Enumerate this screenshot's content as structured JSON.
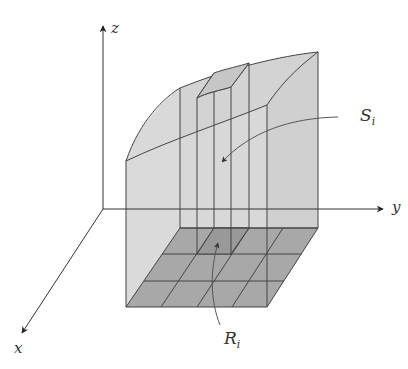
{
  "diagram": {
    "type": "3d-solid-over-rectangle",
    "axes": {
      "x_label": "x",
      "y_label": "y",
      "z_label": "z"
    },
    "labels": {
      "surface_patch": "S",
      "surface_patch_sub": "i",
      "region_patch": "R",
      "region_patch_sub": "i"
    },
    "grid": {
      "columns": 4,
      "rows": 3
    },
    "colors": {
      "wall_fill": "#d6d6d6",
      "floor_fill": "#a9a9a9",
      "line": "#444444",
      "axis": "#333333",
      "background": "#ffffff"
    }
  }
}
